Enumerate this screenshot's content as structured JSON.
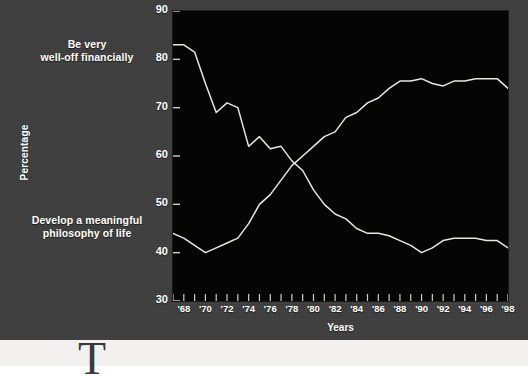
{
  "figure": {
    "background_color": "#3d3d3d",
    "plot_background_color": "#050505",
    "line_color": "#e8e6e0",
    "text_color": "#ffffff"
  },
  "annotations": {
    "wealth_line1": "Be very",
    "wealth_line2": "well-off financially",
    "philosophy_line1": "Develop a meaningful",
    "philosophy_line2": "philosophy of life"
  },
  "axes": {
    "xlabel": "Years",
    "ylabel": "Percentage",
    "y_ticks": [
      90,
      80,
      70,
      60,
      50,
      40,
      30
    ],
    "x_tick_labels": [
      "'68",
      "'70",
      "'72",
      "'74",
      "'76",
      "'78",
      "'80",
      "'82",
      "'84",
      "'86",
      "'88",
      "'90",
      "'92",
      "'94",
      "'96",
      "'98"
    ]
  },
  "page": {
    "dropcap": "T"
  },
  "chart_data": {
    "type": "line",
    "title": "",
    "subtitle": "",
    "xlabel": "Years",
    "ylabel": "Percentage",
    "xlim": [
      1967,
      1998
    ],
    "ylim": [
      30,
      90
    ],
    "grid": false,
    "legend_position": "inline-annotations",
    "x": [
      1967,
      1968,
      1969,
      1970,
      1971,
      1972,
      1973,
      1974,
      1975,
      1976,
      1977,
      1978,
      1979,
      1980,
      1981,
      1982,
      1983,
      1984,
      1985,
      1986,
      1987,
      1988,
      1989,
      1990,
      1991,
      1992,
      1993,
      1994,
      1995,
      1996,
      1997,
      1998
    ],
    "x_tick_labels": [
      "'68",
      "'70",
      "'72",
      "'74",
      "'76",
      "'78",
      "'80",
      "'82",
      "'84",
      "'86",
      "'88",
      "'90",
      "'92",
      "'94",
      "'96",
      "'98"
    ],
    "series": [
      {
        "name": "Develop a meaningful philosophy of life",
        "color": "#e8e6e0",
        "values": [
          83,
          83,
          81.5,
          75,
          69,
          71,
          70,
          62,
          64,
          61.5,
          62,
          59,
          57,
          53,
          50,
          48,
          47,
          45,
          44,
          44,
          43.5,
          42.5,
          41.5,
          40,
          41,
          42.5,
          43,
          43,
          43,
          42.5,
          42.5,
          41
        ]
      },
      {
        "name": "Be very well-off financially",
        "color": "#e8e6e0",
        "values": [
          44,
          43,
          41.5,
          40,
          41,
          42,
          43,
          46,
          50,
          52,
          55,
          58,
          60,
          62,
          64,
          65,
          68,
          69,
          71,
          72,
          74,
          75.5,
          75.5,
          76,
          75,
          74.5,
          75.5,
          75.5,
          76,
          76,
          76,
          74
        ]
      }
    ]
  }
}
